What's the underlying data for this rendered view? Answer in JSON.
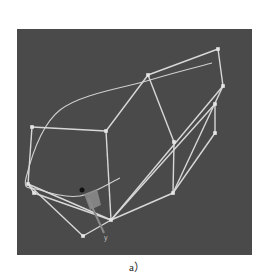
{
  "figure": {
    "caption": "a）",
    "viewport_background": "#4a4a4a",
    "wire_color": "#d8d8d8",
    "curve_color": "#cfcfcf",
    "vertex_color": "#e6e6e6",
    "gizmo_color": "#8a8a8a",
    "axis_label": "y"
  },
  "wireframe": {
    "vertices": {
      "A": [
        32,
        127
      ],
      "B": [
        106,
        131
      ],
      "C": [
        148,
        75
      ],
      "D": [
        218,
        49
      ],
      "E": [
        223,
        86
      ],
      "F": [
        215,
        104
      ],
      "G": [
        215,
        133
      ],
      "H": [
        174,
        142
      ],
      "I": [
        173,
        193
      ],
      "J": [
        111,
        220
      ],
      "K": [
        83,
        236
      ],
      "L": [
        28,
        184
      ],
      "M": [
        34,
        193
      ]
    },
    "edges": [
      [
        "A",
        "B"
      ],
      [
        "A",
        "L"
      ],
      [
        "B",
        "C"
      ],
      [
        "B",
        "J"
      ],
      [
        "C",
        "D"
      ],
      [
        "D",
        "E"
      ],
      [
        "C",
        "H"
      ],
      [
        "H",
        "I"
      ],
      [
        "E",
        "J"
      ],
      [
        "E",
        "I"
      ],
      [
        "F",
        "G"
      ],
      [
        "G",
        "I"
      ],
      [
        "I",
        "J"
      ],
      [
        "J",
        "K"
      ],
      [
        "L",
        "K"
      ],
      [
        "L",
        "J"
      ],
      [
        "M",
        "J"
      ],
      [
        "L",
        "M"
      ],
      [
        "F",
        "J"
      ]
    ]
  },
  "curve": {
    "points": [
      [
        212,
        63
      ],
      [
        150,
        80
      ],
      [
        60,
        110
      ],
      [
        26,
        178
      ],
      [
        40,
        190
      ],
      [
        80,
        196
      ],
      [
        120,
        178
      ]
    ]
  }
}
